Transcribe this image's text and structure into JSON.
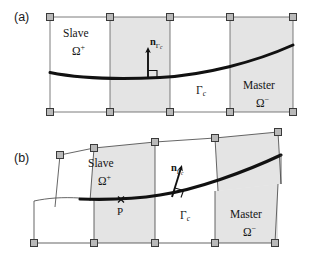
{
  "figure": {
    "background_color": "#ffffff",
    "line_color": "#4a4a4a",
    "thick_line_color": "#111111",
    "shade_color": "#e2e2e2",
    "node_fill": "#b9b9b9",
    "node_stroke": "#3a3a3a",
    "panels": [
      {
        "tag": "(a)",
        "caption": "undeformed reference configuration",
        "labels": {
          "slave_body": "Slave",
          "slave_domain": "Ω",
          "slave_domain_sup": "+",
          "master_body": "Master",
          "master_domain": "Ω",
          "master_domain_sup": "−",
          "contact_surface": "Γ",
          "contact_surface_sub": "c",
          "normal_symbol": "n",
          "normal_sub": "Γ",
          "normal_sub_sub": "c"
        }
      },
      {
        "tag": "(b)",
        "caption": "deformed configuration with contact point",
        "labels": {
          "slave_body": "Slave",
          "slave_domain": "Ω",
          "slave_domain_sup": "+",
          "master_body": "Master",
          "master_domain": "Ω",
          "master_domain_sup": "−",
          "contact_surface": "Γ",
          "contact_surface_sub": "c",
          "normal_symbol": "n",
          "normal_sub": "Γ",
          "normal_sub_sub": "c",
          "contact_point": "P",
          "contact_point_marker": "×"
        }
      }
    ],
    "icons": {
      "node_marker": "square-node-icon",
      "normal_arrow": "normal-vector-arrow-icon",
      "right_angle": "right-angle-icon",
      "contact_point_cross": "cross-marker-icon"
    }
  }
}
